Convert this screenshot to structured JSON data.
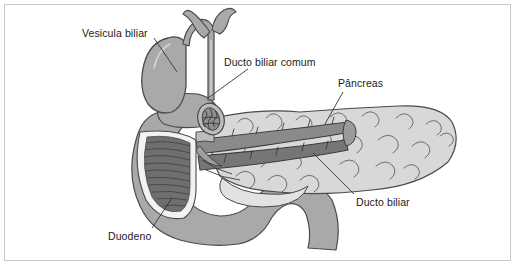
{
  "figure": {
    "language": "pt-BR",
    "border_color": "#c9c9c9",
    "background_color": "#ffffff"
  },
  "palette": {
    "organ_gray": "#a9a9a9",
    "organ_gray_dark": "#8d8d8d",
    "duct_dark": "#8a8a8a",
    "duct_darker": "#767676",
    "pancreas_light": "#d8d8d8",
    "pancreas_lighter": "#e2e2e2",
    "mucosa_dark": "#6f6f6f",
    "outline": "#4a4a4a",
    "lumen_white": "#f2f2f2",
    "text": "#1a1a1a",
    "leader_line": "#333333"
  },
  "labels": [
    {
      "id": "gallbladder",
      "text": "Vesicula biliar",
      "x": 82,
      "y": 28,
      "leader": {
        "x1": 154,
        "y1": 38,
        "x2": 177,
        "y2": 72
      }
    },
    {
      "id": "common-bile-duct",
      "text": "Ducto biliar comum",
      "x": 224,
      "y": 57,
      "leader": {
        "x1": 248,
        "y1": 69,
        "x2": 208,
        "y2": 98
      }
    },
    {
      "id": "pancreas",
      "text": "Pâncreas",
      "x": 338,
      "y": 78,
      "leader": {
        "x1": 343,
        "y1": 92,
        "x2": 325,
        "y2": 124
      }
    },
    {
      "id": "bile-duct",
      "text": "Ducto biliar",
      "x": 356,
      "y": 197,
      "leader": {
        "x1": 354,
        "y1": 194,
        "x2": 313,
        "y2": 153
      }
    },
    {
      "id": "duodenum",
      "text": "Duodeno",
      "x": 108,
      "y": 231,
      "leader": {
        "x1": 152,
        "y1": 228,
        "x2": 172,
        "y2": 198
      }
    }
  ],
  "structures": [
    {
      "id": "gallbladder",
      "name": "Vesícula biliar"
    },
    {
      "id": "hepatic-ducts",
      "name": "Ductos hepáticos"
    },
    {
      "id": "cystic-duct",
      "name": "Ducto cístico"
    },
    {
      "id": "common-bile-duct",
      "name": "Ducto biliar comum"
    },
    {
      "id": "duct-cross-section",
      "name": "Corte transversal do ducto"
    },
    {
      "id": "duodenum",
      "name": "Duodeno"
    },
    {
      "id": "duodenal-mucosa",
      "name": "Pregas da mucosa duodenal"
    },
    {
      "id": "pancreas",
      "name": "Pâncreas"
    },
    {
      "id": "pancreatic-duct",
      "name": "Ducto pancreático"
    }
  ]
}
